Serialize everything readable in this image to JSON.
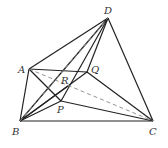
{
  "figure": {
    "type": "geometry",
    "points": {
      "A": {
        "label": "A",
        "x": 29,
        "y": 69,
        "lx": 18,
        "ly": 73
      },
      "B": {
        "label": "B",
        "x": 20,
        "y": 121,
        "lx": 12,
        "ly": 135
      },
      "C": {
        "label": "C",
        "x": 153,
        "y": 121,
        "lx": 149,
        "ly": 135
      },
      "D": {
        "label": "D",
        "x": 108,
        "y": 18,
        "lx": 104,
        "ly": 14
      },
      "Q": {
        "label": "Q",
        "x": 87,
        "y": 72,
        "lx": 91,
        "ly": 73
      },
      "P": {
        "label": "P",
        "x": 61,
        "y": 101,
        "lx": 57,
        "ly": 113
      },
      "R": {
        "label": "R",
        "x": 68,
        "y": 86,
        "lx": 61,
        "ly": 84
      }
    },
    "solid_segments": [
      [
        "A",
        "D"
      ],
      [
        "D",
        "C"
      ],
      [
        "B",
        "C"
      ],
      [
        "A",
        "B"
      ],
      [
        "A",
        "Q"
      ],
      [
        "Q",
        "C"
      ],
      [
        "A",
        "P"
      ],
      [
        "P",
        "C"
      ],
      [
        "B",
        "Q"
      ],
      [
        "B",
        "D"
      ],
      [
        "P",
        "D"
      ],
      [
        "Q",
        "D"
      ],
      [
        "B",
        "P"
      ],
      [
        "B",
        "R"
      ]
    ],
    "dashed_segments": [
      [
        "A",
        "C"
      ],
      [
        "B",
        "D"
      ]
    ],
    "stroke_color": "#222222",
    "dash_color": "#888888"
  }
}
